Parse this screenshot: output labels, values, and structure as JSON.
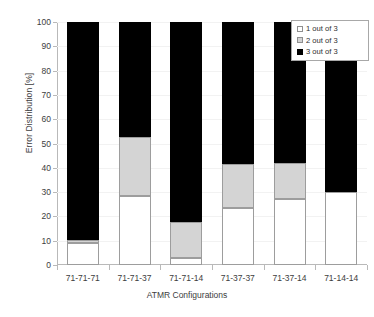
{
  "chart_data": {
    "type": "bar",
    "subtype": "stacked-100-percent",
    "title": "",
    "xlabel": "ATMR Configurations",
    "ylabel": "Error Distribution [%]",
    "ylim": [
      0,
      100
    ],
    "ytick_step": 10,
    "yticks": [
      0,
      10,
      20,
      30,
      40,
      50,
      60,
      70,
      80,
      90,
      100
    ],
    "ytick_labels": [
      "0",
      "10",
      "20",
      "30",
      "40",
      "50",
      "60",
      "70",
      "80",
      "90",
      "100"
    ],
    "grid": false,
    "legend_position": "top-right",
    "categories": [
      "71-71-71",
      "71-71-37",
      "71-71-14",
      "71-37-37",
      "71-37-14",
      "71-14-14"
    ],
    "series": [
      {
        "name": "1 out of 3",
        "color": "#ffffff",
        "edgecolor": "#9d9d9d",
        "values": [
          9,
          28.5,
          3,
          23.5,
          27,
          30
        ]
      },
      {
        "name": "2 out of 3",
        "color": "#d4d4d4",
        "edgecolor": "#9d9d9d",
        "values": [
          1.5,
          24,
          14.5,
          18,
          15,
          0
        ]
      },
      {
        "name": "3 out of 3",
        "color": "#000000",
        "edgecolor": "#000000",
        "values": [
          89.5,
          47.5,
          82.5,
          58.5,
          58,
          70
        ]
      }
    ]
  },
  "legend": {
    "items": [
      {
        "label": "1 out of 3",
        "swatch": "white-square-icon"
      },
      {
        "label": "2 out of 3",
        "swatch": "gray-square-icon"
      },
      {
        "label": "3 out of 3",
        "swatch": "black-square-icon"
      }
    ]
  },
  "axes": {
    "y_title": "Error Distribution [%]",
    "x_title": "ATMR Configurations"
  }
}
